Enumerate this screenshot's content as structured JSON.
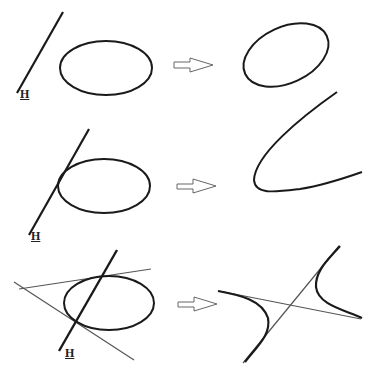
{
  "colors": {
    "stroke": "#1a1a1a",
    "thin_line": "#555555",
    "arrow": "#555555",
    "background": "#ffffff"
  },
  "rows": [
    {
      "id": "row-1",
      "source": "ellipse disjoint from line H",
      "line_label": "H",
      "arrow_icon": "right-arrow-outline-icon",
      "result": "ellipse"
    },
    {
      "id": "row-2",
      "source": "ellipse tangent to line H",
      "line_label": "H",
      "arrow_icon": "right-arrow-outline-icon",
      "result": "parabola"
    },
    {
      "id": "row-3",
      "source": "ellipse intersecting line H with tangent lines at intersection points",
      "line_label": "H",
      "arrow_icon": "right-arrow-outline-icon",
      "result": "hyperbola with asymptotes"
    }
  ]
}
